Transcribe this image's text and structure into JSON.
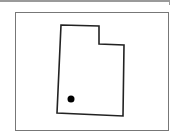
{
  "map": {
    "region": "Utah",
    "outline_points": [
      [
        61,
        25
      ],
      [
        99,
        26
      ],
      [
        99,
        44
      ],
      [
        124,
        45
      ],
      [
        123,
        116
      ],
      [
        57,
        113
      ]
    ],
    "marker": {
      "x": 71,
      "y": 99,
      "r": 3.5,
      "color": "#000000"
    },
    "stroke_color": "#222222",
    "frame_color": "#777777"
  }
}
